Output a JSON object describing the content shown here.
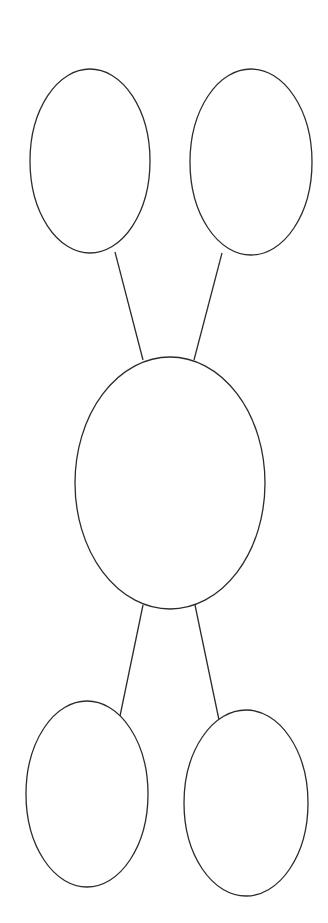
{
  "diagram": {
    "type": "bubble-map",
    "background": "#ffffff",
    "stroke_color": "#2b2b2b",
    "nodes": [
      {
        "id": "top-left",
        "label": "",
        "cx": 90,
        "cy": 161,
        "rx": 60,
        "ry": 92
      },
      {
        "id": "top-right",
        "label": "",
        "cx": 251,
        "cy": 162,
        "rx": 61,
        "ry": 93
      },
      {
        "id": "center",
        "label": "",
        "cx": 170,
        "cy": 483,
        "rx": 95,
        "ry": 126
      },
      {
        "id": "bottom-left",
        "label": "",
        "cx": 87,
        "cy": 794,
        "rx": 61,
        "ry": 93
      },
      {
        "id": "bottom-right",
        "label": "",
        "cx": 246,
        "cy": 803,
        "rx": 62,
        "ry": 93
      }
    ],
    "edges": [
      {
        "from": "top-left",
        "to": "center",
        "x1": 115,
        "y1": 252,
        "x2": 143,
        "y2": 360
      },
      {
        "from": "top-right",
        "to": "center",
        "x1": 222,
        "y1": 253,
        "x2": 194,
        "y2": 360
      },
      {
        "from": "center",
        "to": "bottom-left",
        "x1": 143,
        "y1": 605,
        "x2": 120,
        "y2": 716
      },
      {
        "from": "center",
        "to": "bottom-right",
        "x1": 195,
        "y1": 605,
        "x2": 219,
        "y2": 720
      }
    ]
  }
}
